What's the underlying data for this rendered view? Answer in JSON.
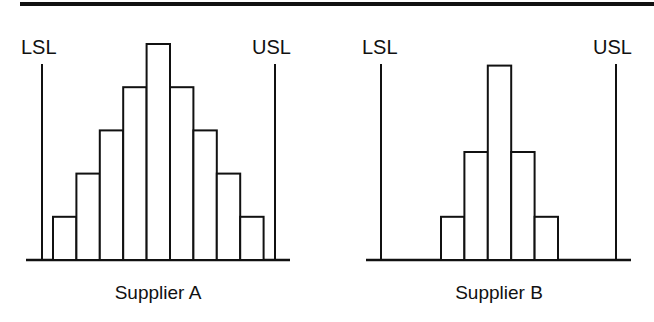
{
  "chart_data": [
    {
      "type": "bar",
      "title": "Supplier A",
      "xlabel": "Supplier A",
      "ylabel": "",
      "annotations": [
        "LSL",
        "USL"
      ],
      "categories": [
        "1",
        "2",
        "3",
        "4",
        "5",
        "6",
        "7",
        "8",
        "9"
      ],
      "values": [
        1,
        2,
        3,
        4,
        5,
        4,
        3,
        2,
        1
      ],
      "ylim": [
        0,
        5
      ],
      "grid": false,
      "spec_limits": {
        "lower_label": "LSL",
        "upper_label": "USL"
      }
    },
    {
      "type": "bar",
      "title": "Supplier B",
      "xlabel": "Supplier B",
      "ylabel": "",
      "annotations": [
        "LSL",
        "USL"
      ],
      "categories": [
        "1",
        "2",
        "3",
        "4",
        "5"
      ],
      "values": [
        1,
        2.5,
        4.5,
        2.5,
        1
      ],
      "ylim": [
        0,
        5
      ],
      "grid": false,
      "spec_limits": {
        "lower_label": "LSL",
        "upper_label": "USL"
      }
    }
  ],
  "panels": {
    "a": {
      "caption": "Supplier A",
      "lsl": "LSL",
      "usl": "USL"
    },
    "b": {
      "caption": "Supplier B",
      "lsl": "LSL",
      "usl": "USL"
    }
  }
}
